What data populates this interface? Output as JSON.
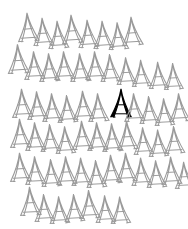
{
  "canvas": {
    "width": 188,
    "height": 229,
    "background_color": "#ffffff",
    "title": "Tower Pattern Grid"
  },
  "style": {
    "normal_stroke_color": "#9a9a9a",
    "highlight_fill_color": "#000000",
    "icon_name": "eiffel-tower-icon",
    "tower_width": 22,
    "tower_height": 30
  },
  "legend": {
    "normal_label": "outline tower",
    "highlight_label": "filled tower"
  },
  "counts": {
    "total_towers": 60,
    "highlighted_towers": 1,
    "rows": 6
  },
  "chart_data": {
    "type": "scatter",
    "xlabel": "",
    "ylabel": "",
    "xlim": [
      0,
      188
    ],
    "ylim": [
      0,
      229
    ],
    "grid": false,
    "legend_position": "none",
    "rows": [
      {
        "row": 1,
        "count": 8,
        "towers": [
          {
            "x": 18,
            "y": 12,
            "rot": -4,
            "scale": 1.0,
            "filled": false
          },
          {
            "x": 33,
            "y": 16,
            "rot": -4,
            "scale": 0.97,
            "filled": false
          },
          {
            "x": 48,
            "y": 19,
            "rot": -4,
            "scale": 0.97,
            "filled": false
          },
          {
            "x": 62,
            "y": 14,
            "rot": -4,
            "scale": 1.0,
            "filled": false
          },
          {
            "x": 78,
            "y": 18,
            "rot": -4,
            "scale": 0.97,
            "filled": false
          },
          {
            "x": 93,
            "y": 19,
            "rot": -4,
            "scale": 0.97,
            "filled": false
          },
          {
            "x": 108,
            "y": 20,
            "rot": -4,
            "scale": 0.95,
            "filled": false
          },
          {
            "x": 122,
            "y": 16,
            "rot": -4,
            "scale": 1.0,
            "filled": false
          }
        ]
      },
      {
        "row": 2,
        "count": 11,
        "towers": [
          {
            "x": 8,
            "y": 44,
            "rot": -3,
            "scale": 1.02,
            "filled": false
          },
          {
            "x": 24,
            "y": 50,
            "rot": -3,
            "scale": 0.98,
            "filled": false
          },
          {
            "x": 39,
            "y": 52,
            "rot": -3,
            "scale": 0.98,
            "filled": false
          },
          {
            "x": 54,
            "y": 50,
            "rot": -3,
            "scale": 0.98,
            "filled": false
          },
          {
            "x": 70,
            "y": 52,
            "rot": -3,
            "scale": 0.98,
            "filled": false
          },
          {
            "x": 85,
            "y": 50,
            "rot": -3,
            "scale": 0.98,
            "filled": false
          },
          {
            "x": 100,
            "y": 52,
            "rot": -3,
            "scale": 0.96,
            "filled": false
          },
          {
            "x": 116,
            "y": 55,
            "rot": -3,
            "scale": 0.95,
            "filled": false
          },
          {
            "x": 131,
            "y": 57,
            "rot": -3,
            "scale": 0.93,
            "filled": false
          },
          {
            "x": 148,
            "y": 59,
            "rot": -3,
            "scale": 0.93,
            "filled": false
          },
          {
            "x": 163,
            "y": 60,
            "rot": -3,
            "scale": 0.92,
            "filled": false
          }
        ]
      },
      {
        "row": 3,
        "count": 11,
        "towers": [
          {
            "x": 12,
            "y": 88,
            "rot": -3,
            "scale": 1.0,
            "filled": false
          },
          {
            "x": 27,
            "y": 90,
            "rot": -3,
            "scale": 0.98,
            "filled": false
          },
          {
            "x": 42,
            "y": 92,
            "rot": -3,
            "scale": 0.98,
            "filled": false
          },
          {
            "x": 57,
            "y": 93,
            "rot": -3,
            "scale": 0.96,
            "filled": false
          },
          {
            "x": 73,
            "y": 90,
            "rot": -3,
            "scale": 1.0,
            "filled": false
          },
          {
            "x": 88,
            "y": 92,
            "rot": -3,
            "scale": 0.98,
            "filled": false
          },
          {
            "x": 110,
            "y": 88,
            "rot": 0,
            "scale": 1.0,
            "filled": true
          },
          {
            "x": 124,
            "y": 92,
            "rot": -3,
            "scale": 0.98,
            "filled": false
          },
          {
            "x": 139,
            "y": 94,
            "rot": -3,
            "scale": 0.96,
            "filled": false
          },
          {
            "x": 154,
            "y": 96,
            "rot": -3,
            "scale": 0.95,
            "filled": false
          },
          {
            "x": 169,
            "y": 92,
            "rot": -3,
            "scale": 0.98,
            "filled": false
          }
        ]
      },
      {
        "row": 4,
        "count": 11,
        "towers": [
          {
            "x": 10,
            "y": 118,
            "rot": -3,
            "scale": 1.0,
            "filled": false
          },
          {
            "x": 25,
            "y": 121,
            "rot": -3,
            "scale": 0.98,
            "filled": false
          },
          {
            "x": 40,
            "y": 122,
            "rot": -3,
            "scale": 0.96,
            "filled": false
          },
          {
            "x": 55,
            "y": 124,
            "rot": -3,
            "scale": 0.95,
            "filled": false
          },
          {
            "x": 72,
            "y": 120,
            "rot": -3,
            "scale": 1.0,
            "filled": false
          },
          {
            "x": 87,
            "y": 121,
            "rot": -3,
            "scale": 0.98,
            "filled": false
          },
          {
            "x": 102,
            "y": 122,
            "rot": -3,
            "scale": 0.98,
            "filled": false
          },
          {
            "x": 117,
            "y": 120,
            "rot": -3,
            "scale": 1.0,
            "filled": false
          },
          {
            "x": 133,
            "y": 125,
            "rot": -3,
            "scale": 0.95,
            "filled": false
          },
          {
            "x": 148,
            "y": 127,
            "rot": -3,
            "scale": 0.94,
            "filled": false
          },
          {
            "x": 164,
            "y": 124,
            "rot": -3,
            "scale": 0.96,
            "filled": false
          }
        ]
      },
      {
        "row": 5,
        "count": 12,
        "towers": [
          {
            "x": 10,
            "y": 152,
            "rot": -3,
            "scale": 1.0,
            "filled": false
          },
          {
            "x": 25,
            "y": 155,
            "rot": -3,
            "scale": 0.98,
            "filled": false
          },
          {
            "x": 41,
            "y": 157,
            "rot": -3,
            "scale": 0.96,
            "filled": false
          },
          {
            "x": 56,
            "y": 155,
            "rot": -3,
            "scale": 0.98,
            "filled": false
          },
          {
            "x": 71,
            "y": 156,
            "rot": -3,
            "scale": 0.97,
            "filled": false
          },
          {
            "x": 86,
            "y": 158,
            "rot": -3,
            "scale": 0.96,
            "filled": false
          },
          {
            "x": 101,
            "y": 154,
            "rot": -3,
            "scale": 1.0,
            "filled": false
          },
          {
            "x": 116,
            "y": 152,
            "rot": -3,
            "scale": 1.0,
            "filled": false
          },
          {
            "x": 131,
            "y": 156,
            "rot": -3,
            "scale": 0.97,
            "filled": false
          },
          {
            "x": 146,
            "y": 158,
            "rot": -3,
            "scale": 0.95,
            "filled": false
          },
          {
            "x": 161,
            "y": 155,
            "rot": -3,
            "scale": 0.97,
            "filled": false
          },
          {
            "x": 174,
            "y": 159,
            "rot": -3,
            "scale": 0.93,
            "filled": false
          }
        ]
      },
      {
        "row": 6,
        "count": 7,
        "towers": [
          {
            "x": 20,
            "y": 186,
            "rot": -3,
            "scale": 1.0,
            "filled": false
          },
          {
            "x": 34,
            "y": 192,
            "rot": -3,
            "scale": 0.96,
            "filled": false
          },
          {
            "x": 49,
            "y": 194,
            "rot": -3,
            "scale": 0.95,
            "filled": false
          },
          {
            "x": 64,
            "y": 192,
            "rot": -3,
            "scale": 0.96,
            "filled": false
          },
          {
            "x": 79,
            "y": 189,
            "rot": -3,
            "scale": 0.99,
            "filled": false
          },
          {
            "x": 95,
            "y": 193,
            "rot": -3,
            "scale": 0.95,
            "filled": false
          },
          {
            "x": 110,
            "y": 194,
            "rot": -3,
            "scale": 0.94,
            "filled": false
          }
        ]
      }
    ]
  }
}
